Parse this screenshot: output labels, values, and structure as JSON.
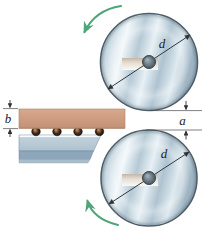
{
  "figure": {
    "labels": {
      "top_roller_diameter": "d",
      "bottom_roller_diameter": "d",
      "slab_thickness": "b",
      "roller_gap": "a"
    },
    "icons": {
      "top_rotation_arrow": "curved-arrow-counterclockwise",
      "bottom_rotation_arrow": "curved-arrow-clockwise"
    },
    "colors": {
      "roller_metal_dark": "#9db3c2",
      "roller_metal_light": "#f1f7fa",
      "roller_outline": "#4e5e69",
      "hub_dark": "#49565f",
      "slab": "#cd9b80",
      "slab_edge": "#a97f66",
      "table_top": "#bfd0db",
      "table_band": "#8ea6b9",
      "table_strip": "#aabdcb",
      "rotation_arrow_green": "#4da578",
      "dimension_line": "#3a3a3a"
    }
  }
}
